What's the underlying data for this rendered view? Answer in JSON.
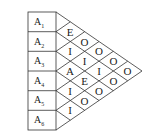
{
  "diagram": {
    "rows": [
      "A",
      "A",
      "A",
      "A",
      "A",
      "A"
    ],
    "row_subscripts": [
      "1",
      "2",
      "3",
      "4",
      "5",
      "6"
    ],
    "matrix": [
      {
        "pair": "A1-A2",
        "value": "E"
      },
      {
        "pair": "A1-A3",
        "value": "O"
      },
      {
        "pair": "A1-A4",
        "value": "O"
      },
      {
        "pair": "A1-A5",
        "value": "O"
      },
      {
        "pair": "A1-A6",
        "value": "O"
      },
      {
        "pair": "A2-A3",
        "value": "I"
      },
      {
        "pair": "A2-A4",
        "value": "I"
      },
      {
        "pair": "A2-A5",
        "value": "O"
      },
      {
        "pair": "A2-A6",
        "value": "O"
      },
      {
        "pair": "A3-A4",
        "value": "A"
      },
      {
        "pair": "A3-A5",
        "value": "I"
      },
      {
        "pair": "A3-A6",
        "value": "O"
      },
      {
        "pair": "A4-A5",
        "value": "I"
      },
      {
        "pair": "A4-A6",
        "value": "E"
      },
      {
        "pair": "A5-A6",
        "value": "I"
      }
    ],
    "cells": {
      "c12": "E",
      "c23": "I",
      "c34": "A",
      "c45": "I",
      "c56": "I",
      "c13": "O",
      "c24": "I",
      "c35": "E",
      "c46": "O",
      "c14": "O",
      "c25": "I",
      "c36": "O",
      "c15": "O",
      "c26": "O",
      "c16": "O"
    }
  }
}
